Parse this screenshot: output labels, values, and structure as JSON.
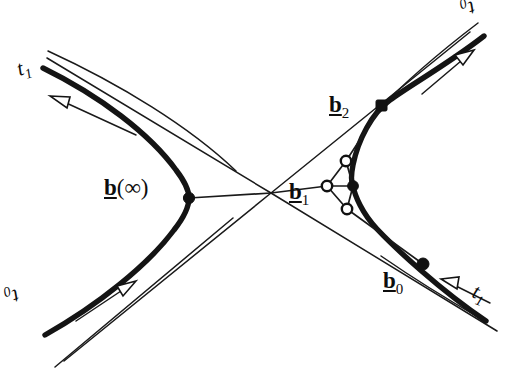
{
  "figure": {
    "type": "geometric-diagram",
    "background_color": "#ffffff",
    "ink_color": "#111111",
    "width": 527,
    "height": 372
  },
  "labels": {
    "b_infinity": {
      "symbol": "b",
      "argument": "(∞)",
      "text": "b(∞)"
    },
    "b0": {
      "symbol": "b",
      "subscript": "0",
      "text": "b0"
    },
    "b1": {
      "symbol": "b",
      "subscript": "1",
      "text": "b1"
    },
    "b2": {
      "symbol": "b",
      "subscript": "2",
      "text": "b2"
    },
    "t1_top_left": {
      "symbol": "t",
      "subscript": "1",
      "text": "t1"
    },
    "t0_top_right": {
      "symbol": "t",
      "subscript": "0",
      "text": "t0"
    },
    "t0_bottom_left": {
      "symbol": "t",
      "subscript": "0",
      "text": "t0"
    },
    "t1_bottom_right": {
      "symbol": "t",
      "subscript": "1",
      "text": "t1"
    }
  },
  "points": {
    "b_infinity": {
      "x": 189,
      "y": 198,
      "marker": "filled-dot"
    },
    "b2": {
      "x": 382,
      "y": 106,
      "marker": "filled-square"
    },
    "b0": {
      "x": 423,
      "y": 264,
      "marker": "filled-dot"
    },
    "casteljau_upper": {
      "x": 346,
      "y": 161,
      "marker": "open-circle"
    },
    "casteljau_left": {
      "x": 327,
      "y": 186,
      "marker": "open-circle"
    },
    "casteljau_curve": {
      "x": 353,
      "y": 186,
      "marker": "filled-dot"
    },
    "casteljau_lower": {
      "x": 347,
      "y": 209,
      "marker": "open-circle"
    },
    "asymptote_crossing": {
      "x": 271,
      "y": 193,
      "marker": "none"
    }
  },
  "arrows": {
    "top_left": {
      "label": "t1",
      "direction": "up-left",
      "style": "open-outline"
    },
    "bottom_left": {
      "label": "t0",
      "direction": "up-right",
      "style": "open-outline"
    },
    "top_right": {
      "label": "t0",
      "direction": "up-right",
      "style": "open-outline"
    },
    "bottom_right": {
      "label": "t1",
      "direction": "up-left",
      "style": "open-outline"
    }
  },
  "curves": {
    "left_branch": "thick hyperbola branch opening left",
    "right_branch": "thick hyperbola branch opening right",
    "asymptote_count": 2,
    "thin_polygon": "control polygon connecting b(infinity), b1 and casteljau points"
  }
}
